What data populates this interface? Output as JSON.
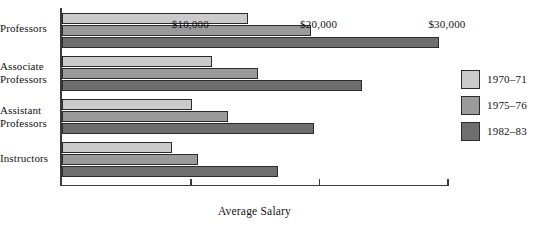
{
  "chart_data": {
    "type": "bar",
    "orientation": "horizontal",
    "title": "",
    "xlabel": "Average Salary",
    "ylabel": "",
    "categories": [
      "Professors",
      "Associate\nProfessors",
      "Assistant\nProfessors",
      "Instructors"
    ],
    "series": [
      {
        "name": "1970–71",
        "color": "#cbcbcb",
        "values": [
          14500,
          11700,
          10100,
          8600
        ]
      },
      {
        "name": "1975–76",
        "color": "#9a9a9a",
        "values": [
          19400,
          15300,
          12900,
          10600
        ]
      },
      {
        "name": "1982–83",
        "color": "#6e6e6e",
        "values": [
          29400,
          23400,
          19600,
          16800
        ]
      }
    ],
    "xlim": [
      0,
      30000
    ],
    "xticks": [
      10000,
      20000,
      30000
    ],
    "xtick_labels": [
      "$10,000",
      "$20,000",
      "$30,000"
    ],
    "grid": false,
    "legend_position": "right"
  },
  "legend": {
    "items": [
      {
        "label": "1970–71",
        "color": "#cbcbcb"
      },
      {
        "label": "1975–76",
        "color": "#9a9a9a"
      },
      {
        "label": "1982–83",
        "color": "#6e6e6e"
      }
    ]
  },
  "axis": {
    "x_title": "Average Salary",
    "tick_labels": [
      "$10,000",
      "$20,000",
      "$30,000"
    ]
  },
  "categories": [
    "Professors",
    "Associate\nProfessors",
    "Assistant\nProfessors",
    "Instructors"
  ]
}
